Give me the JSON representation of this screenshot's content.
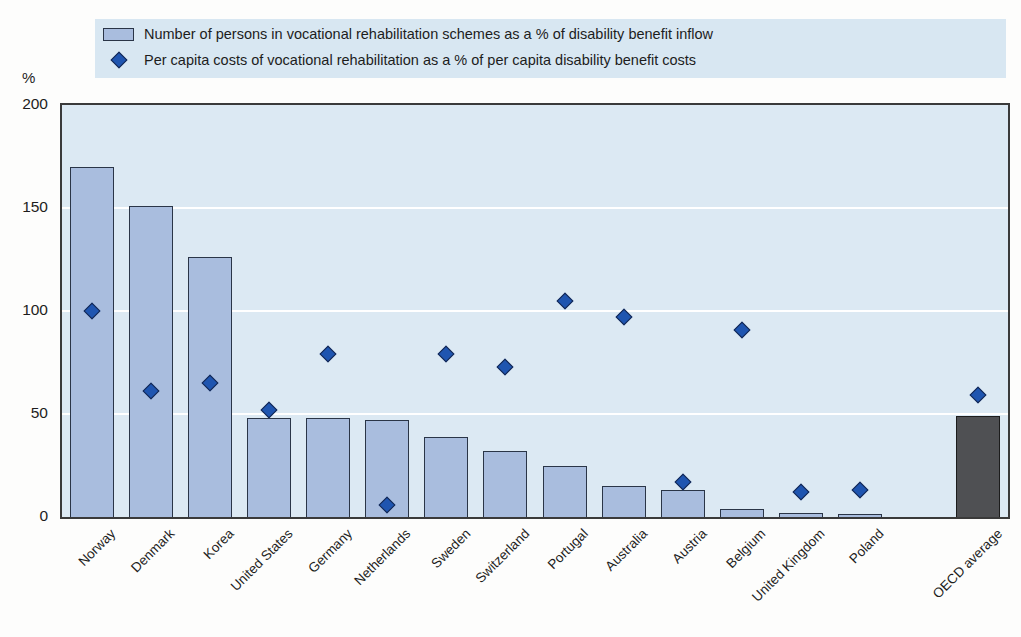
{
  "legend": {
    "items": [
      {
        "marker": "bar-swatch",
        "label": "Number of persons in vocational rehabilitation schemes as a % of disability benefit inflow"
      },
      {
        "marker": "diamond",
        "label": "Per capita costs of vocational rehabilitation as a % of per capita disability benefit costs"
      }
    ]
  },
  "chart_data": {
    "type": "bar",
    "subtype": "bar-with-diamond-scatter-overlay",
    "categories": [
      "Norway",
      "Denmark",
      "Korea",
      "United States",
      "Germany",
      "Netherlands",
      "Sweden",
      "Switzerland",
      "Portugal",
      "Australia",
      "Austria",
      "Belgium",
      "United Kingdom",
      "Poland",
      "OECD average"
    ],
    "series": [
      {
        "name": "Number of persons in vocational rehabilitation schemes as a % of disability benefit inflow",
        "type": "bar",
        "values": [
          170,
          151,
          126,
          48,
          48,
          47,
          39,
          32,
          25,
          15,
          13,
          4,
          2,
          1.5,
          49
        ]
      },
      {
        "name": "Per capita costs of vocational rehabilitation as a % of per capita disability benefit costs",
        "type": "scatter",
        "values": [
          100,
          61,
          65,
          52,
          79,
          6,
          79,
          73,
          105,
          97,
          17,
          91,
          12,
          13,
          59
        ]
      }
    ],
    "ylabel": "%",
    "ylim": [
      0,
      200
    ],
    "yticks": [
      0,
      50,
      100,
      150,
      200
    ],
    "grid": "horizontal",
    "legend_position": "top-left",
    "gap_slot_before_last_category": true,
    "highlight_category": "OECD average",
    "colors": {
      "bar_fill": "#a9bdde",
      "bar_border": "#2a3547",
      "oecd_bar_fill": "#4f5053",
      "oecd_bar_border": "#1c1c1c",
      "diamond_fill": "#1f55b0",
      "diamond_border": "#15264e",
      "plot_bg": "#dce9f3",
      "legend_bg": "#d8e7f2",
      "gridline": "#ffffff"
    }
  }
}
